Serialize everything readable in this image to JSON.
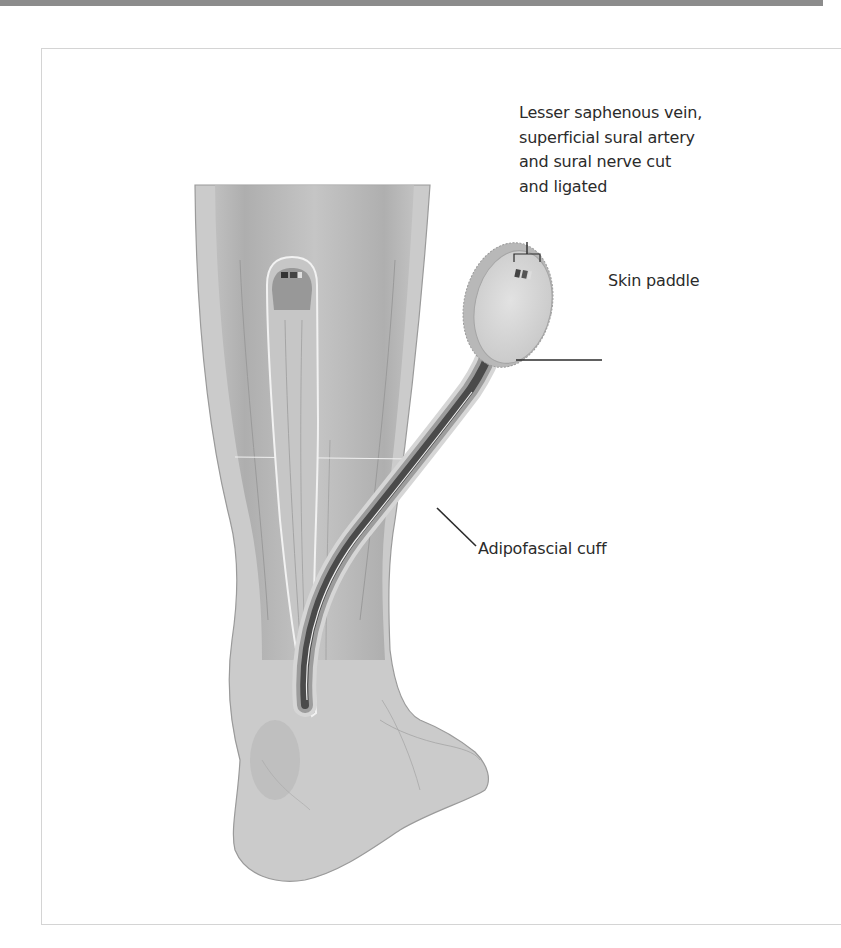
{
  "figure": {
    "type": "anatomical-illustration",
    "colors": {
      "top_bar": "#8c8c8c",
      "frame_border": "#d4d4d4",
      "skin": "#cfcfcf",
      "pedicle_dark": "#4a4a4a",
      "label_text": "#2b2b2b"
    }
  },
  "labels": {
    "vessels": {
      "lines": [
        "Lesser saphenous vein,",
        "superficial sural artery",
        "and sural nerve cut",
        "and ligated"
      ]
    },
    "skin_paddle": "Skin paddle",
    "adipofascial_cuff": "Adipofascial cuff"
  }
}
